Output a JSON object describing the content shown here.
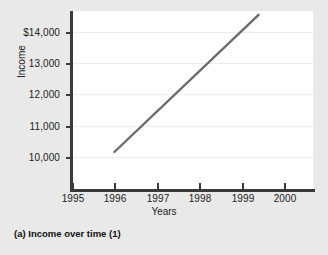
{
  "caption": "(a)  Income over time (1)",
  "colors": {
    "background": "#e9e9e9",
    "panel": "#ffffff",
    "axis": "#3a3a3a",
    "gridline": "#ededed",
    "series_line": "#6b6b6b",
    "text": "#1c1c1c"
  },
  "chart_data": {
    "type": "line",
    "title": "",
    "subtitle": "",
    "xlabel": "Years",
    "ylabel": "Income",
    "xlim": [
      1995,
      2000.65
    ],
    "ylim": [
      9450,
      14800
    ],
    "xticks": [
      1995,
      1996,
      1997,
      1998,
      1999,
      2000
    ],
    "xticklabels": [
      "1995",
      "1996",
      "1997",
      "1998",
      "1999",
      "2000"
    ],
    "yticks": [
      10000,
      11000,
      12000,
      13000,
      14000
    ],
    "yticklabels": [
      "10,000",
      "11,000",
      "12,000",
      "13,000",
      "$14,000"
    ],
    "grid": true,
    "grid_axis": "y",
    "legend": false,
    "legend_position": "none",
    "series": [
      {
        "name": "Income",
        "x": [
          1996.0,
          1999.4
        ],
        "values": [
          10160,
          14550
        ]
      }
    ],
    "annotations": []
  }
}
